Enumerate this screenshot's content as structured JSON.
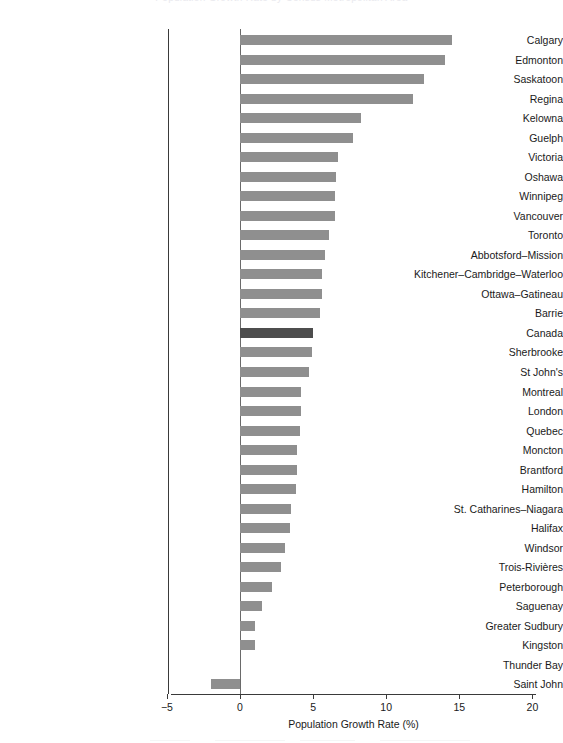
{
  "title_faint": "Population Growth Rate by Census Metropolitan Area",
  "axis": {
    "xlabel": "Population Growth Rate (%)",
    "ticks": [
      "−5",
      "0",
      "5",
      "10",
      "15",
      "20"
    ],
    "tick_values": [
      -5,
      0,
      5,
      10,
      15,
      20
    ],
    "xmin": -5,
    "xmax": 20
  },
  "colors": {
    "bar": "#8f8f8f",
    "bar_highlight": "#4d4d4d",
    "axis": "#3a3a3a",
    "text": "#1a1a1a",
    "background": "#ffffff"
  },
  "chart_data": {
    "type": "bar",
    "orientation": "horizontal",
    "title": "",
    "xlabel": "Population Growth Rate (%)",
    "ylabel": "",
    "xlim": [
      -5,
      20
    ],
    "grid": false,
    "legend": "none",
    "highlight_category": "Canada",
    "categories": [
      "Calgary",
      "Edmonton",
      "Saskatoon",
      "Regina",
      "Kelowna",
      "Guelph",
      "Victoria",
      "Oshawa",
      "Winnipeg",
      "Vancouver",
      "Toronto",
      "Abbotsford–Mission",
      "Kitchener–Cambridge–Waterloo",
      "Ottawa–Gatineau",
      "Barrie",
      "Canada",
      "Sherbrooke",
      "St  John's",
      "Montreal",
      "London",
      "Quebec",
      "Moncton",
      "Brantford",
      "Hamilton",
      "St. Catharines–Niagara",
      "Halifax",
      "Windsor",
      "Trois-Rivières",
      "Peterborough",
      "Saguenay",
      "Greater Sudbury",
      "Kingston",
      "Thunder Bay",
      "Saint John"
    ],
    "values": [
      14.5,
      14.0,
      12.6,
      11.8,
      8.3,
      7.7,
      6.7,
      6.6,
      6.5,
      6.5,
      6.1,
      5.8,
      5.6,
      5.6,
      5.5,
      5.0,
      4.9,
      4.7,
      4.2,
      4.2,
      4.1,
      3.9,
      3.9,
      3.8,
      3.5,
      3.4,
      3.1,
      2.8,
      2.2,
      1.5,
      1.0,
      1.0,
      0.0,
      -2.0
    ]
  }
}
